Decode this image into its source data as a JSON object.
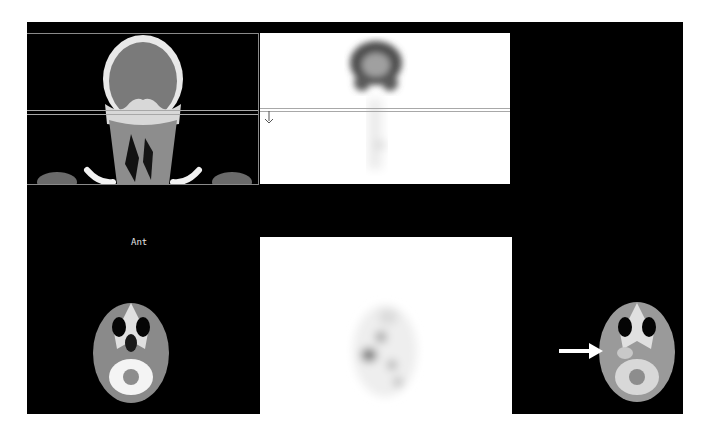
{
  "viewer": {
    "background": "#000000",
    "panels": [
      {
        "id": "ct-coronal",
        "view": "CT coronal"
      },
      {
        "id": "pet-coronal",
        "view": "PET coronal"
      },
      {
        "id": "ct-axial",
        "view": "CT axial"
      },
      {
        "id": "pet-axial",
        "view": "PET axial"
      },
      {
        "id": "fused-axial",
        "view": "Fused PET/CT axial"
      }
    ],
    "orientation_label": "Ant",
    "crosshair_color": "#a8a8a8",
    "annotation": {
      "type": "arrow",
      "color": "#ffffff",
      "direction": "right"
    }
  }
}
